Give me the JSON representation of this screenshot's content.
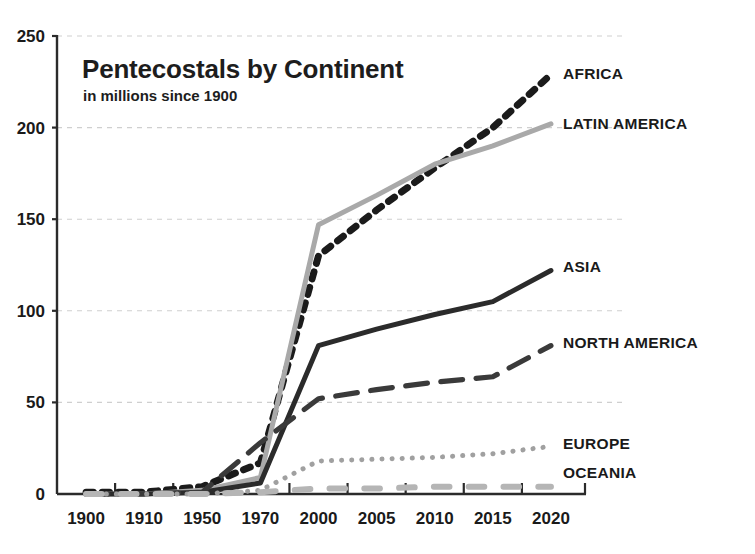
{
  "chart_data": {
    "type": "line",
    "title": "Pentecostals by Continent",
    "subtitle": "in millions since 1900",
    "xlabel": "",
    "ylabel": "",
    "ylim": [
      0,
      250
    ],
    "yticks": [
      0,
      50,
      100,
      150,
      200,
      250
    ],
    "ytick_labels": [
      "0",
      "50",
      "100",
      "150",
      "200",
      "250"
    ],
    "grid": true,
    "legend_position": "right-inline",
    "categories": [
      "1900",
      "1910",
      "1950",
      "1970",
      "2000",
      "2005",
      "2010",
      "2015",
      "2020"
    ],
    "x": [
      1900,
      1910,
      1950,
      1970,
      2000,
      2005,
      2010,
      2015,
      2020
    ],
    "series": [
      {
        "name": "AFRICA",
        "label": "AFRICA",
        "color": "#1b1b1b",
        "style": "dashed",
        "values": [
          1,
          1,
          4,
          17,
          130,
          155,
          178,
          200,
          229
        ]
      },
      {
        "name": "LATIN AMERICA",
        "label": "LATIN AMERICA",
        "color": "#a9a9a9",
        "style": "solid",
        "values": [
          0,
          0,
          2,
          9,
          147,
          163,
          180,
          190,
          202
        ]
      },
      {
        "name": "ASIA",
        "label": "ASIA",
        "color": "#2b2b2b",
        "style": "solid",
        "values": [
          0,
          0,
          1,
          6,
          81,
          90,
          98,
          105,
          122
        ]
      },
      {
        "name": "NORTH AMERICA",
        "label": "NORTH AMERICA",
        "color": "#3a3a3a",
        "style": "long-dashed",
        "values": [
          0,
          0,
          1,
          28,
          52,
          57,
          61,
          64,
          81
        ]
      },
      {
        "name": "EUROPE",
        "label": "EUROPE",
        "color": "#a0a0a0",
        "style": "dotted",
        "values": [
          0,
          0,
          0,
          2,
          18,
          19,
          20,
          22,
          26
        ]
      },
      {
        "name": "OCEANIA",
        "label": "OCEANIA",
        "color": "#b5b5b5",
        "style": "short-dashed",
        "values": [
          0,
          0,
          0,
          1,
          3,
          3,
          4,
          4,
          4
        ]
      }
    ]
  },
  "labels": {
    "africa": "AFRICA",
    "latin_america": "LATIN AMERICA",
    "asia": "ASIA",
    "north_america": "NORTH AMERICA",
    "europe": "EUROPE",
    "oceania": "OCEANIA"
  },
  "title": "Pentecostals by Continent",
  "subtitle": "in millions since 1900"
}
